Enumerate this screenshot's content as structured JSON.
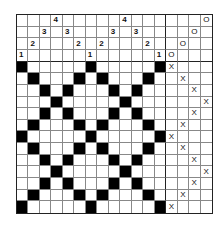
{
  "draft": {
    "type": "weaving-draft",
    "pattern": "point twill (diamond)",
    "grid": {
      "columns": 17,
      "rows": 17,
      "threading_columns": 13,
      "treadle_columns": 4,
      "shaft_rows": 4,
      "pick_rows": 13
    },
    "threading": [
      1,
      2,
      3,
      4,
      3,
      2,
      1,
      2,
      3,
      4,
      3,
      2,
      1
    ],
    "shaft_rows_top_to_bottom": [
      4,
      3,
      2,
      1
    ],
    "tieup": {
      "symbol": "O",
      "ties": [
        {
          "treadle": 1,
          "shaft": 1
        },
        {
          "treadle": 2,
          "shaft": 2
        },
        {
          "treadle": 3,
          "shaft": 3
        },
        {
          "treadle": 4,
          "shaft": 4
        }
      ]
    },
    "treadling": {
      "symbol": "X",
      "sequence": [
        1,
        2,
        3,
        4,
        3,
        2,
        1,
        2,
        3,
        4,
        3,
        2,
        1
      ]
    },
    "colors": {
      "filled": "#000000",
      "empty": "#ffffff",
      "grid": "#888888",
      "border": "#222222"
    }
  }
}
